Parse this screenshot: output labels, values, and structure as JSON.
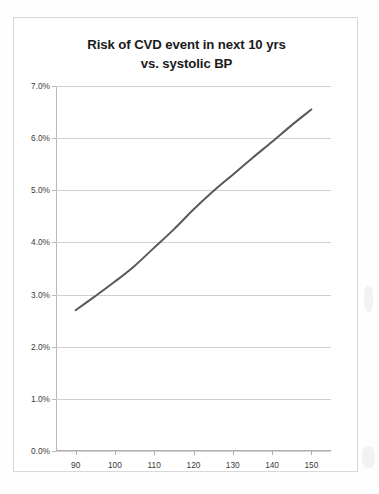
{
  "chart_data": {
    "type": "line",
    "title": "Risk of CVD event in next 10 yrs vs. systolic BP",
    "title_line1": "Risk of CVD event in next 10 yrs",
    "title_line2": "vs. systolic BP",
    "xlabel": "",
    "ylabel": "",
    "xlim": [
      85,
      155
    ],
    "ylim": [
      0,
      7
    ],
    "grid": true,
    "legend": false,
    "legend_position": "none",
    "line_color": "#595959",
    "gridline_color": "#d0d0d0",
    "axis_color": "#b8b8b8",
    "x_tick_labels": [
      "90",
      "100",
      "110",
      "120",
      "130",
      "140",
      "150"
    ],
    "x_ticks": [
      90,
      100,
      110,
      120,
      130,
      140,
      150
    ],
    "y_tick_labels": [
      "0.0%",
      "1.0%",
      "2.0%",
      "3.0%",
      "4.0%",
      "5.0%",
      "6.0%",
      "7.0%"
    ],
    "y_ticks": [
      0,
      1,
      2,
      3,
      4,
      5,
      6,
      7
    ],
    "series": [
      {
        "name": "Risk of CVD event in next 10 yrs",
        "x": [
          90,
          95,
          100,
          105,
          110,
          115,
          120,
          125,
          130,
          135,
          140,
          145,
          150
        ],
        "values": [
          2.7,
          2.97,
          3.25,
          3.55,
          3.9,
          4.25,
          4.63,
          4.98,
          5.3,
          5.62,
          5.93,
          6.25,
          6.55
        ]
      }
    ]
  }
}
